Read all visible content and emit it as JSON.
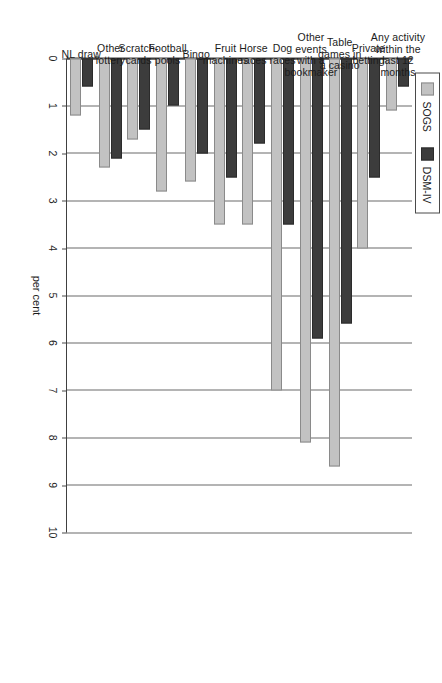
{
  "legend": {
    "position": "top-left",
    "entries": [
      {
        "label": "SOGS",
        "color": "#c2c2c2",
        "icon": "legend-swatch-sogs"
      },
      {
        "label": "DSM-IV",
        "color": "#3c3c3c",
        "icon": "legend-swatch-dsm"
      }
    ]
  },
  "axis": {
    "value_title": "per cent",
    "ticks": [
      "0",
      "1",
      "2",
      "3",
      "4",
      "5",
      "6",
      "7",
      "8",
      "9",
      "10"
    ]
  },
  "chart_data": {
    "type": "bar",
    "title": "",
    "subtitle": "",
    "orientation": "horizontal",
    "xlabel": "",
    "ylabel": "per cent",
    "ylim": [
      0,
      10
    ],
    "grid": true,
    "legend_position": "top-left",
    "categories": [
      "NL draw",
      "Other lottery",
      "Scratch-cards",
      "Football pools",
      "Bingo",
      "Fruit machines",
      "Horse races",
      "Dog races",
      "Other events with a bookmaker",
      "Table games in a casino",
      "Private betting",
      "Any activity within the last 12 months"
    ],
    "category_label_lines": [
      [
        "NL draw"
      ],
      [
        "Other",
        "lottery"
      ],
      [
        "Scratch-",
        "cards"
      ],
      [
        "Football",
        "pools"
      ],
      [
        "Bingo"
      ],
      [
        "Fruit",
        "machines"
      ],
      [
        "Horse",
        "races"
      ],
      [
        "Dog",
        "races"
      ],
      [
        "Other",
        "events",
        "with a",
        "bookmaker"
      ],
      [
        "Table",
        "games in",
        "a casino"
      ],
      [
        "Private",
        "betting"
      ],
      [
        "Any activity",
        "within the",
        "last 12",
        "months"
      ]
    ],
    "series": [
      {
        "name": "SOGS",
        "color": "#c2c2c2",
        "values": [
          1.2,
          2.3,
          1.7,
          2.8,
          2.6,
          3.5,
          3.5,
          7.0,
          8.1,
          8.6,
          4.0,
          1.1
        ]
      },
      {
        "name": "DSM-IV",
        "color": "#3c3c3c",
        "values": [
          0.6,
          2.1,
          1.5,
          1.0,
          2.0,
          2.5,
          1.8,
          3.5,
          5.9,
          5.6,
          2.5,
          0.6
        ]
      }
    ]
  }
}
